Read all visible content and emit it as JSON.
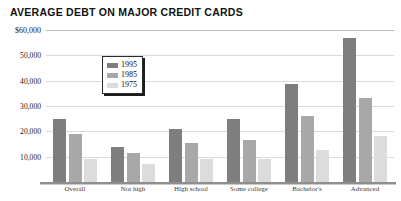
{
  "chart_data": {
    "type": "bar",
    "title": "AVERAGE DEBT ON MAJOR CREDIT CARDS",
    "xlabel": "",
    "ylabel": "",
    "ylim": [
      0,
      60000
    ],
    "grid": true,
    "legend_position": "inside-top-left",
    "categories": [
      "Overall",
      "Not high",
      "High school",
      "Some college",
      "Bachelor's",
      "Advanced"
    ],
    "ytick_labels": [
      "$60,000",
      "50,000",
      "40,000",
      "30,000",
      "20,000",
      "10,000"
    ],
    "ytick_values": [
      60000,
      50000,
      40000,
      30000,
      20000,
      10000
    ],
    "series": [
      {
        "name": "1995",
        "color": "#7f7e7e",
        "values": [
          25000,
          14000,
          21000,
          25000,
          38500,
          57000
        ]
      },
      {
        "name": "1985",
        "color": "#a9a8a8",
        "values": [
          19000,
          11500,
          15500,
          16500,
          26000,
          33000
        ]
      },
      {
        "name": "1975",
        "color": "#dcdcdc",
        "values": [
          9000,
          7000,
          9000,
          9000,
          12500,
          18000
        ]
      }
    ]
  }
}
